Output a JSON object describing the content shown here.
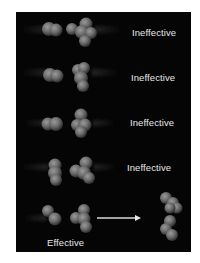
{
  "figure": {
    "background_color": "#050505",
    "text_color": "#e6e6e6",
    "rows": [
      {
        "label": "Ineffective",
        "outcome": "ineffective"
      },
      {
        "label": "Ineffective",
        "outcome": "ineffective"
      },
      {
        "label": "Ineffective",
        "outcome": "ineffective"
      },
      {
        "label": "Ineffective",
        "outcome": "ineffective"
      },
      {
        "label": "Effective",
        "outcome": "effective"
      }
    ],
    "arrow_icon": "right-arrow"
  }
}
